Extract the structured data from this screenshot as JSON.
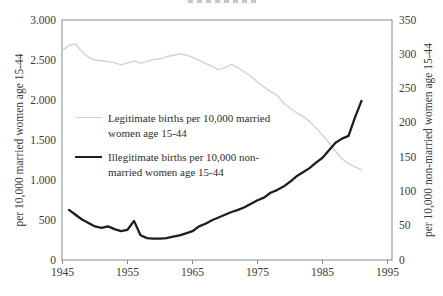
{
  "chart_data": {
    "type": "line",
    "title": "",
    "title_note": "title cropped out of frame at top edge",
    "x_axis": {
      "tick_labels": [
        "1945",
        "1955",
        "1965",
        "1975",
        "1985",
        "1995"
      ],
      "tick_values": [
        1945,
        1955,
        1965,
        1975,
        1985,
        1995
      ],
      "range": [
        1945,
        1995
      ]
    },
    "left_axis": {
      "label": "per 10,000 married women age 15-44",
      "tick_labels": [
        "3.000",
        "2.500",
        "2.000",
        "1.500",
        "1.000",
        "500",
        "0"
      ],
      "tick_values": [
        3000,
        2500,
        2000,
        1500,
        1000,
        500,
        0
      ],
      "range": [
        0,
        3000
      ]
    },
    "right_axis": {
      "label": "per 10,000 non-married women age 15-44",
      "tick_labels": [
        "350",
        "300",
        "250",
        "200",
        "150",
        "100",
        "50",
        "0"
      ],
      "tick_values": [
        350,
        300,
        250,
        200,
        150,
        100,
        50,
        0
      ],
      "range": [
        0,
        350
      ]
    },
    "grid": false,
    "legend": {
      "position": "middle-left",
      "items": [
        {
          "line1": "Legitimate births per 10,000 married",
          "line2": "women age 15-44"
        },
        {
          "line1": "Illegitimate births per 10,000 non-",
          "line2": "married women age 15-44"
        }
      ]
    },
    "series": [
      {
        "name": "Legitimate births per 10,000 married women age 15-44",
        "axis": "left",
        "color": "#d2d2d2",
        "stroke_width": 1.4,
        "years": [
          1945,
          1946,
          1947,
          1948,
          1949,
          1950,
          1951,
          1952,
          1953,
          1954,
          1955,
          1956,
          1957,
          1958,
          1959,
          1960,
          1961,
          1962,
          1963,
          1964,
          1965,
          1966,
          1967,
          1968,
          1969,
          1970,
          1971,
          1972,
          1973,
          1974,
          1975,
          1976,
          1977,
          1978,
          1979,
          1980,
          1981,
          1982,
          1983,
          1984,
          1985,
          1986,
          1987,
          1988,
          1989,
          1990,
          1991
        ],
        "values": [
          2620,
          2685,
          2700,
          2605,
          2535,
          2500,
          2490,
          2480,
          2465,
          2440,
          2462,
          2485,
          2460,
          2482,
          2505,
          2515,
          2540,
          2560,
          2575,
          2562,
          2532,
          2498,
          2455,
          2425,
          2380,
          2405,
          2445,
          2405,
          2350,
          2295,
          2225,
          2160,
          2105,
          2060,
          1960,
          1900,
          1840,
          1795,
          1730,
          1650,
          1560,
          1465,
          1360,
          1265,
          1205,
          1165,
          1128
        ]
      },
      {
        "name": "Illegitimate births per 10,000 non-married women age 15-44",
        "axis": "right",
        "color": "#1e1e1e",
        "stroke_width": 2.3,
        "years": [
          1946,
          1947,
          1948,
          1949,
          1950,
          1951,
          1952,
          1953,
          1954,
          1955,
          1956,
          1957,
          1958,
          1959,
          1960,
          1961,
          1962,
          1963,
          1964,
          1965,
          1966,
          1967,
          1968,
          1969,
          1970,
          1971,
          1972,
          1973,
          1974,
          1975,
          1976,
          1977,
          1978,
          1979,
          1980,
          1981,
          1982,
          1983,
          1984,
          1985,
          1986,
          1987,
          1988,
          1989,
          1990,
          1991
        ],
        "values": [
          73,
          66,
          59,
          54,
          49,
          47,
          49,
          45,
          42,
          44,
          57,
          36,
          32,
          31,
          31,
          32,
          34,
          36,
          39,
          42,
          49,
          53,
          58,
          62,
          66,
          70,
          73,
          77,
          82,
          87,
          91,
          98,
          102,
          107,
          114,
          122,
          128,
          134,
          142,
          149,
          160,
          171,
          177,
          181,
          208,
          232
        ]
      }
    ],
    "plot_frame_color": "#8a8a8a"
  }
}
